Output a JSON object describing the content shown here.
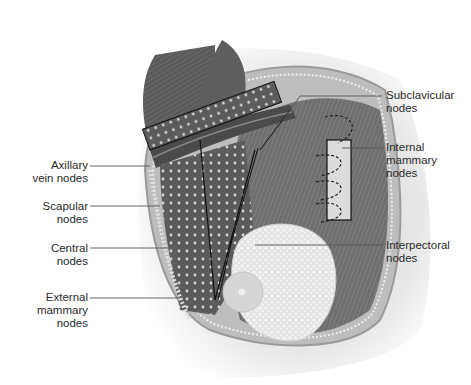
{
  "figure": {
    "colors": {
      "background": "#ffffff",
      "muscle_dark": "#4a4a4a",
      "muscle_mid": "#7a7a7a",
      "skin_shadow": "#d8d8d8",
      "breast_tissue": "#e6e6e6",
      "leader_line": "#555555",
      "text": "#2a2a2a"
    }
  },
  "labels": {
    "left": [
      {
        "id": "axillary-vein-nodes",
        "line1": "Axillary",
        "line2": "vein nodes",
        "line3": ""
      },
      {
        "id": "scapular-nodes",
        "line1": "Scapular",
        "line2": "nodes",
        "line3": ""
      },
      {
        "id": "central-nodes",
        "line1": "Central",
        "line2": "nodes",
        "line3": ""
      },
      {
        "id": "external-mammary-nodes",
        "line1": "External",
        "line2": "mammary",
        "line3": "nodes"
      }
    ],
    "right": [
      {
        "id": "subclavicular-nodes",
        "line1": "Subclavicular",
        "line2": "nodes",
        "line3": ""
      },
      {
        "id": "internal-mammary-nodes",
        "line1": "Internal",
        "line2": "mammary",
        "line3": "nodes"
      },
      {
        "id": "interpectoral-nodes",
        "line1": "Interpectoral",
        "line2": "nodes",
        "line3": ""
      }
    ]
  }
}
